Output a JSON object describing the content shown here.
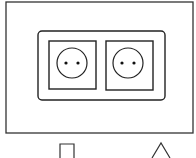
{
  "diagram": {
    "stroke_color": "#222222",
    "background_color": "#ffffff",
    "outer_panel": {
      "x": 6,
      "y": 2,
      "w": 187,
      "h": 131
    },
    "frame": {
      "x": 38,
      "y": 31,
      "w": 127,
      "h": 69,
      "rx": 4
    },
    "sockets": [
      {
        "id": "left",
        "square": {
          "x": 49,
          "y": 41,
          "w": 47,
          "h": 48
        },
        "circle": {
          "cx": 72,
          "cy": 63,
          "r": 15
        },
        "pins": [
          {
            "cx": 66,
            "cy": 63
          },
          {
            "cx": 78,
            "cy": 63
          }
        ]
      },
      {
        "id": "right",
        "square": {
          "x": 106,
          "y": 41,
          "w": 47,
          "h": 49
        },
        "circle": {
          "cx": 128,
          "cy": 63,
          "r": 15
        },
        "pins": [
          {
            "cx": 122,
            "cy": 63
          },
          {
            "cx": 134,
            "cy": 63
          }
        ]
      }
    ],
    "symbols": [
      {
        "name": "square-symbol",
        "shape": "square"
      },
      {
        "name": "triangle-symbol",
        "shape": "triangle"
      }
    ]
  }
}
